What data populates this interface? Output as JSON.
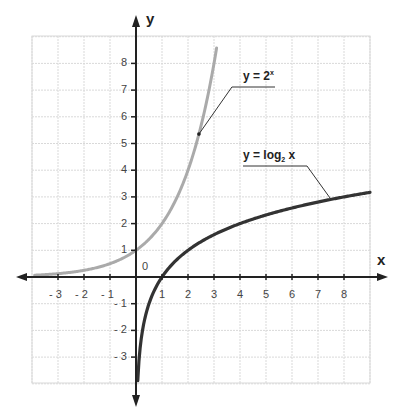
{
  "chart_data": {
    "type": "line",
    "title": "",
    "xlabel": "x",
    "ylabel": "y",
    "xlim": [
      -4,
      9
    ],
    "ylim": [
      -4,
      9
    ],
    "grid": true,
    "origin_label": "0",
    "x_ticks": [
      -3,
      -2,
      -1,
      1,
      2,
      3,
      4,
      5,
      6,
      7,
      8
    ],
    "x_tick_labels": [
      "- 3",
      "- 2",
      "- 1",
      "1",
      "2",
      "3",
      "4",
      "5",
      "6",
      "7",
      "8"
    ],
    "y_ticks": [
      -3,
      -2,
      -1,
      1,
      2,
      3,
      4,
      5,
      6,
      7,
      8
    ],
    "y_tick_labels": [
      "- 3",
      "- 2",
      "- 1",
      "1",
      "2",
      "3",
      "4",
      "5",
      "6",
      "7",
      "8"
    ],
    "series": [
      {
        "name": "y = 2^x",
        "label_main": "y = 2",
        "label_sup": "x",
        "color": "#aaaaaa",
        "x": [
          -3.9,
          -3,
          -2,
          -1,
          0,
          1,
          2,
          2.4,
          3,
          3.1
        ],
        "values": [
          0.07,
          0.125,
          0.25,
          0.5,
          1,
          2,
          4,
          5.28,
          8,
          8.57
        ]
      },
      {
        "name": "y = log2 x",
        "label_main": "y = log",
        "label_sub": "2",
        "label_tail": " x",
        "color": "#333333",
        "x": [
          0.07,
          0.125,
          0.25,
          0.5,
          1,
          2,
          4,
          7.5,
          9
        ],
        "values": [
          -3.84,
          -3,
          -2,
          -1,
          0,
          1,
          2,
          2.91,
          3.17
        ]
      }
    ]
  },
  "colors": {
    "grid": "#d9d9d9",
    "axis": "#222222",
    "exp_curve": "#aaaaaa",
    "log_curve": "#333333"
  }
}
